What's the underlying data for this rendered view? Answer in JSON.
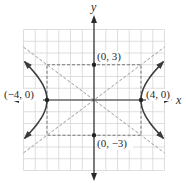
{
  "figure": {
    "type": "hyperbola-graph",
    "equation_implied": "x^2/16 - y^2/9 = 1",
    "axes": {
      "x_label": "x",
      "y_label": "y"
    },
    "grid": {
      "min": -6,
      "max": 6,
      "step": 1
    },
    "vertices": [
      {
        "label": "(−4, 0)",
        "x": -4,
        "y": 0
      },
      {
        "label": "(4, 0)",
        "x": 4,
        "y": 0
      }
    ],
    "co_vertices": [
      {
        "label": "(0, 3)",
        "x": 0,
        "y": 3
      },
      {
        "label": "(0, −3)",
        "x": 0,
        "y": -3
      }
    ],
    "asymptotes": [
      "y = 3x/4",
      "y = -3x/4"
    ],
    "central_rectangle": {
      "x_min": -4,
      "x_max": 4,
      "y_min": -3,
      "y_max": 3
    },
    "colors": {
      "curve": "#3a3a3a",
      "axes": "#2a2a2a",
      "grid": "#d4d4d4",
      "dashed": "#8a8a8a"
    }
  }
}
